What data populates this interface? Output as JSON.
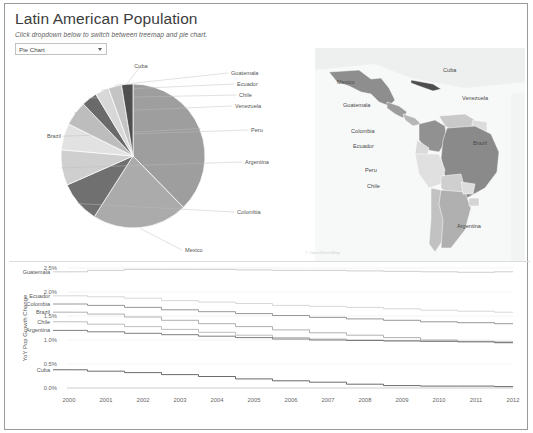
{
  "header": {
    "title": "Latin American Population",
    "subtitle": "Click dropdown below to switch between treemap and pie chart.",
    "dropdown_value": "Pie Chart",
    "dropdown_options": [
      "Pie Chart",
      "Treemap"
    ]
  },
  "map": {
    "attribution": "© OpenStreetMap",
    "labels": [
      {
        "name": "Mexico",
        "x": 22,
        "y": 36
      },
      {
        "name": "Cuba",
        "x": 128,
        "y": 24
      },
      {
        "name": "Guatemala",
        "x": 28,
        "y": 59
      },
      {
        "name": "Venezuela",
        "x": 147,
        "y": 52
      },
      {
        "name": "Colombia",
        "x": 36,
        "y": 85
      },
      {
        "name": "Ecuador",
        "x": 38,
        "y": 100
      },
      {
        "name": "Brazil",
        "x": 158,
        "y": 97
      },
      {
        "name": "Peru",
        "x": 50,
        "y": 124
      },
      {
        "name": "Chile",
        "x": 52,
        "y": 140
      },
      {
        "name": "Argentina",
        "x": 142,
        "y": 180
      }
    ]
  },
  "chart_data": [
    {
      "type": "pie",
      "title": "",
      "slices": [
        {
          "label": "Brazil",
          "value": 35.4,
          "color": "#9e9e9e"
        },
        {
          "label": "Mexico",
          "value": 20.1,
          "color": "#ababab"
        },
        {
          "label": "Colombia",
          "value": 8.8,
          "color": "#707070"
        },
        {
          "label": "Argentina",
          "value": 7.5,
          "color": "#cfcfcf"
        },
        {
          "label": "Peru",
          "value": 5.6,
          "color": "#e2e2e2"
        },
        {
          "label": "Venezuela",
          "value": 5.2,
          "color": "#bdbdbd"
        },
        {
          "label": "Chile",
          "value": 3.3,
          "color": "#6a6a6a"
        },
        {
          "label": "Ecuador",
          "value": 2.9,
          "color": "#d8d8d8"
        },
        {
          "label": "Guatemala",
          "value": 2.8,
          "color": "#c4c4c4"
        },
        {
          "label": "Cuba",
          "value": 2.4,
          "color": "#4f4f4f"
        }
      ],
      "legend_position": "callout-labels"
    },
    {
      "type": "line",
      "title": "",
      "xlabel": "",
      "ylabel": "YoY Pop Growth Change",
      "x": [
        2000,
        2001,
        2002,
        2003,
        2004,
        2005,
        2006,
        2007,
        2008,
        2009,
        2010,
        2011,
        2012
      ],
      "xlim": [
        2000,
        2012
      ],
      "ylim": [
        0.0,
        2.5
      ],
      "ytick_labels": [
        "0.0%",
        "0.5%",
        "1.0%",
        "1.5%",
        "2.0%",
        "2.5%"
      ],
      "ytick_values": [
        0.0,
        0.5,
        1.0,
        1.5,
        2.0,
        2.5
      ],
      "grid": true,
      "series": [
        {
          "name": "Guatemala",
          "color": "#c8c8c8",
          "values": [
            2.42,
            2.45,
            2.47,
            2.47,
            2.47,
            2.46,
            2.45,
            2.45,
            2.44,
            2.43,
            2.42,
            2.41,
            2.42
          ]
        },
        {
          "name": "Ecuador",
          "color": "#d2d2d2",
          "values": [
            1.92,
            1.9,
            1.87,
            1.82,
            1.79,
            1.76,
            1.72,
            1.7,
            1.68,
            1.65,
            1.62,
            1.6,
            1.58
          ]
        },
        {
          "name": "Colombia",
          "color": "#8c8c8c",
          "values": [
            1.75,
            1.72,
            1.68,
            1.63,
            1.59,
            1.55,
            1.51,
            1.47,
            1.44,
            1.41,
            1.38,
            1.36,
            1.34
          ]
        },
        {
          "name": "Brazil",
          "color": "#a8a8a8",
          "values": [
            1.58,
            1.54,
            1.48,
            1.41,
            1.34,
            1.28,
            1.21,
            1.15,
            1.1,
            1.05,
            1.0,
            0.97,
            0.94
          ]
        },
        {
          "name": "Chile",
          "color": "#b5b5b5",
          "values": [
            1.38,
            1.33,
            1.28,
            1.22,
            1.16,
            1.1,
            1.05,
            1.02,
            1.0,
            0.99,
            0.98,
            0.97,
            0.96
          ]
        },
        {
          "name": "Argentina",
          "color": "#6f6f6f",
          "values": [
            1.2,
            1.17,
            1.14,
            1.11,
            1.08,
            1.05,
            1.02,
            1.0,
            0.99,
            0.98,
            0.97,
            0.96,
            0.95
          ]
        },
        {
          "name": "Cuba",
          "color": "#5a5a5a",
          "values": [
            0.38,
            0.35,
            0.32,
            0.28,
            0.24,
            0.19,
            0.15,
            0.12,
            0.08,
            0.05,
            0.04,
            0.04,
            0.03
          ]
        }
      ]
    }
  ]
}
